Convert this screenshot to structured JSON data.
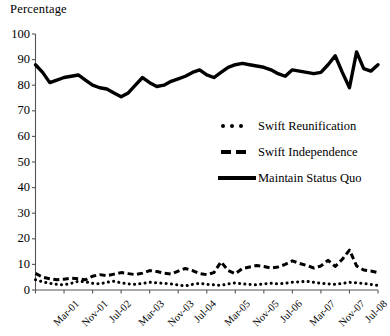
{
  "chart_data": {
    "type": "line",
    "title": "",
    "ylabel": "Percentage",
    "xlabel": "",
    "ylim": [
      0,
      100
    ],
    "ytick_values": [
      0,
      10,
      20,
      30,
      40,
      50,
      60,
      70,
      80,
      90,
      100
    ],
    "ytick_labels": [
      "0",
      "10",
      "20",
      "30",
      "40",
      "50",
      "60",
      "70",
      "80",
      "90",
      "100"
    ],
    "grid": false,
    "legend_position": "center-right",
    "xtick_labels": [
      "Mar-01",
      "Nov-01",
      "Jul-02",
      "Mar-03",
      "Nov-03",
      "Jul-04",
      "Mar-05",
      "Nov-05",
      "Jul-06",
      "Mar-07",
      "Nov-07",
      "Jul-08",
      "Mar-09"
    ],
    "xtick_indices": [
      0,
      4,
      8,
      12,
      16,
      20,
      24,
      28,
      32,
      36,
      40,
      44,
      48
    ],
    "x": [
      "Mar-01",
      "May-01",
      "Jul-01",
      "Sep-01",
      "Nov-01",
      "Jan-02",
      "Mar-02",
      "May-02",
      "Jul-02",
      "Sep-02",
      "Nov-02",
      "Jan-03",
      "Mar-03",
      "May-03",
      "Jul-03",
      "Sep-03",
      "Nov-03",
      "Jan-04",
      "Mar-04",
      "May-04",
      "Jul-04",
      "Sep-04",
      "Nov-04",
      "Jan-05",
      "Mar-05",
      "May-05",
      "Jul-05",
      "Sep-05",
      "Nov-05",
      "Jan-06",
      "Mar-06",
      "May-06",
      "Jul-06",
      "Sep-06",
      "Nov-06",
      "Jan-07",
      "Mar-07",
      "May-07",
      "Jul-07",
      "Sep-07",
      "Nov-07",
      "Jan-08",
      "Mar-08",
      "May-08",
      "Jul-08",
      "Sep-08",
      "Nov-08",
      "Jan-09",
      "Mar-09"
    ],
    "series": [
      {
        "name": "Swift Reunification",
        "style": "dotted",
        "values": [
          4.0,
          3.2,
          2.6,
          2.2,
          2.0,
          2.6,
          3.4,
          3.2,
          2.6,
          2.4,
          3.0,
          3.4,
          2.8,
          2.4,
          2.2,
          2.6,
          3.0,
          2.8,
          2.6,
          2.4,
          2.0,
          1.6,
          2.2,
          2.6,
          2.2,
          2.0,
          1.8,
          2.4,
          2.8,
          2.4,
          2.2,
          2.0,
          2.4,
          2.6,
          2.4,
          2.6,
          3.0,
          3.2,
          3.4,
          3.0,
          2.6,
          2.4,
          2.2,
          2.6,
          3.0,
          2.8,
          2.6,
          2.2,
          1.8
        ]
      },
      {
        "name": "Swift Independence",
        "style": "dashed",
        "values": [
          6.5,
          5.0,
          4.4,
          4.0,
          4.2,
          4.6,
          4.4,
          4.0,
          5.4,
          6.0,
          5.6,
          6.2,
          6.8,
          6.4,
          6.0,
          6.6,
          7.6,
          7.2,
          6.6,
          6.2,
          7.4,
          8.4,
          7.6,
          6.4,
          6.0,
          6.8,
          11.0,
          7.6,
          6.4,
          8.4,
          9.0,
          9.6,
          9.2,
          8.6,
          9.0,
          10.0,
          11.4,
          10.4,
          9.6,
          8.6,
          9.4,
          11.6,
          9.2,
          12.0,
          15.6,
          9.4,
          7.8,
          7.4,
          6.8
        ]
      },
      {
        "name": "Maintain Status Quo",
        "style": "solid",
        "values": [
          88.0,
          85.0,
          81.0,
          82.0,
          83.0,
          83.5,
          84.0,
          82.0,
          80.0,
          79.0,
          78.5,
          77.0,
          75.5,
          77.0,
          80.0,
          83.0,
          81.0,
          79.5,
          80.0,
          81.5,
          82.5,
          83.5,
          85.0,
          86.0,
          84.0,
          83.0,
          85.0,
          87.0,
          88.0,
          88.5,
          88.0,
          87.5,
          87.0,
          86.0,
          84.5,
          83.5,
          86.0,
          85.5,
          85.0,
          84.5,
          85.0,
          88.0,
          91.5,
          85.0,
          79.0,
          93.0,
          86.5,
          85.5,
          88.0
        ]
      }
    ]
  },
  "legend": {
    "entries": [
      {
        "label": "Swift Reunification",
        "marker": "dots-marker"
      },
      {
        "label": "Swift Independence",
        "marker": "dashes-marker"
      },
      {
        "label": "Maintain Status Quo",
        "marker": "solid-bar-marker"
      }
    ]
  }
}
